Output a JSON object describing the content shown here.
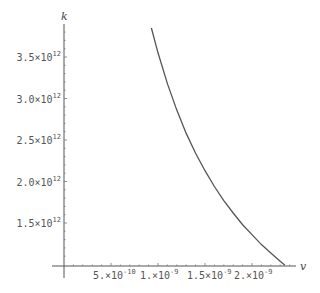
{
  "chart_data": {
    "type": "line",
    "title": "",
    "xlabel": "v",
    "ylabel": "k",
    "xlim": [
      0,
      2.45e-09
    ],
    "ylim": [
      1000000000000.0,
      3850000000000.0
    ],
    "grid": false,
    "legend": null,
    "x_ticks": [
      {
        "value": 5e-10,
        "mantissa": "5.",
        "exponent": "-10"
      },
      {
        "value": 1e-09,
        "mantissa": "1.",
        "exponent": "-9"
      },
      {
        "value": 1.5e-09,
        "mantissa": "1.5",
        "exponent": "-9"
      },
      {
        "value": 2e-09,
        "mantissa": "2.",
        "exponent": "-9"
      }
    ],
    "y_ticks": [
      {
        "value": 1500000000000.0,
        "mantissa": "1.5",
        "exponent": "12"
      },
      {
        "value": 2000000000000.0,
        "mantissa": "2.0",
        "exponent": "12"
      },
      {
        "value": 2500000000000.0,
        "mantissa": "2.5",
        "exponent": "12"
      },
      {
        "value": 3000000000000.0,
        "mantissa": "3.0",
        "exponent": "12"
      },
      {
        "value": 3500000000000.0,
        "mantissa": "3.5",
        "exponent": "12"
      }
    ],
    "series": [
      {
        "name": "k(v)",
        "color": "#555555",
        "x": [
          9.3e-10,
          1e-09,
          1.1e-09,
          1.2e-09,
          1.3e-09,
          1.4e-09,
          1.5e-09,
          1.6e-09,
          1.7e-09,
          1.8e-09,
          1.9e-09,
          2e-09,
          2.1e-09,
          2.2e-09,
          2.3e-09,
          2.35e-09
        ],
        "y": [
          3850000000000.0,
          3550000000000.0,
          3180000000000.0,
          2860000000000.0,
          2580000000000.0,
          2340000000000.0,
          2130000000000.0,
          1940000000000.0,
          1770000000000.0,
          1620000000000.0,
          1480000000000.0,
          1360000000000.0,
          1240000000000.0,
          1140000000000.0,
          1040000000000.0,
          990000000000.0
        ]
      }
    ]
  },
  "axes": {
    "x_label": "v",
    "y_label": "k",
    "times_sign": "×",
    "base": "10"
  }
}
